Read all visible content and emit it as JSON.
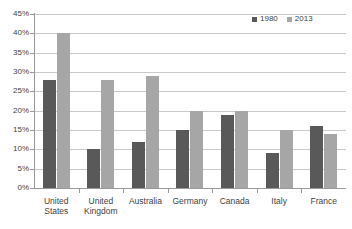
{
  "chart_data": {
    "type": "bar",
    "title": "",
    "subtitle": "",
    "xlabel": "",
    "ylabel": "",
    "categories": [
      "United States",
      "United Kingdom",
      "Australia",
      "Germany",
      "Canada",
      "Italy",
      "France"
    ],
    "series": [
      {
        "name": "1980",
        "color": "#595959",
        "values": [
          28,
          10,
          12,
          15,
          19,
          9,
          16
        ]
      },
      {
        "name": "2013",
        "color": "#a6a6a6",
        "values": [
          40,
          28,
          29,
          20,
          20,
          15,
          14
        ]
      }
    ],
    "ylim": [
      0,
      45
    ],
    "ytick_step": 5,
    "ytick_labels": [
      "0%",
      "5%",
      "10%",
      "15%",
      "20%",
      "25%",
      "30%",
      "35%",
      "40%",
      "45%"
    ],
    "ytick_values": [
      0,
      5,
      10,
      15,
      20,
      25,
      30,
      35,
      40,
      45
    ],
    "value_suffix": "%",
    "grid": "horizontal",
    "legend_position": "top-right",
    "legend_orientation": "horizontal",
    "plot_background": "#ffffff",
    "grid_color": "#c9c9c9",
    "axis_color": "#9a9a9a"
  }
}
